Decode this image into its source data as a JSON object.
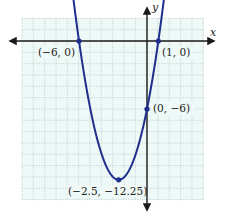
{
  "chart_data": {
    "type": "line",
    "title": "",
    "xlabel": "x",
    "ylabel": "y",
    "function": "y = x^2 + 5x - 6",
    "grid": true,
    "xlim": [
      -11,
      5
    ],
    "ylim": [
      -14,
      2
    ],
    "series": [
      {
        "name": "parabola",
        "color": "#1f2e8c",
        "x": [
          -6.6,
          -6,
          -5,
          -4,
          -3,
          -2.5,
          -2,
          -1,
          0,
          1,
          1.6
        ],
        "y": [
          3.96,
          0,
          -6,
          -10,
          -12,
          -12.25,
          -12,
          -10,
          -6,
          0,
          4.56
        ]
      }
    ],
    "points": [
      {
        "x": -6,
        "y": 0,
        "label": "(−6, 0)"
      },
      {
        "x": 1,
        "y": 0,
        "label": "(1, 0)"
      },
      {
        "x": 0,
        "y": -6,
        "label": "(0, −6)"
      },
      {
        "x": -2.5,
        "y": -12.25,
        "label": "(−2.5, −12.25)"
      }
    ],
    "annotations": [
      "(−6, 0)",
      "(1, 0)",
      "(0, −6)",
      "(−2.5, −12.25)"
    ]
  },
  "labels": {
    "x_axis": "x",
    "y_axis": "y",
    "p1": "(−6, 0)",
    "p2": "(1, 0)",
    "p3": "(0, −6)",
    "p4": "(−2.5, −12.25)"
  },
  "colors": {
    "curve": "#1f2e8c",
    "grid_bg": "#eef8f6",
    "grid_line": "#9fb8b4",
    "axis": "#1a1a1a"
  }
}
